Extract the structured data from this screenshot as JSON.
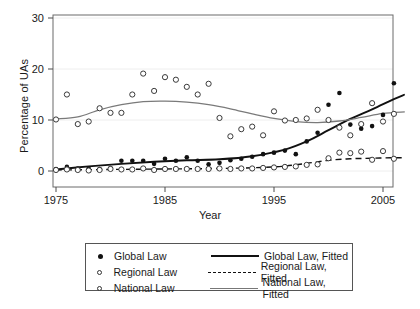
{
  "chart_data": {
    "type": "scatter",
    "title": "",
    "xlabel": "Year",
    "ylabel": "Percentage of UAs",
    "xlim": [
      1974,
      2008
    ],
    "ylim": [
      -1,
      31
    ],
    "xticks": [
      1975,
      1985,
      1995,
      2005
    ],
    "yticks": [
      0,
      10,
      20,
      30
    ],
    "grid": "horizontal-faint",
    "legend_position": "below-plot",
    "x": [
      1975,
      1976,
      1977,
      1978,
      1979,
      1980,
      1981,
      1982,
      1983,
      1984,
      1985,
      1986,
      1987,
      1988,
      1989,
      1990,
      1991,
      1992,
      1993,
      1994,
      1995,
      1996,
      1997,
      1998,
      1999,
      2000,
      2001,
      2002,
      2003,
      2004,
      2005,
      2006,
      2007
    ],
    "series": [
      {
        "name": "Global Law",
        "marker": "filled-circle",
        "values": [
          0.4,
          0.8,
          0.5,
          0.5,
          0.4,
          0.6,
          2.0,
          2.0,
          2.0,
          1.4,
          2.4,
          2.0,
          2.7,
          2.0,
          1.3,
          1.6,
          2.1,
          2.4,
          2.8,
          3.3,
          3.6,
          4.0,
          3.3,
          5.8,
          7.5,
          13.0,
          15.3,
          9.1,
          8.3,
          8.8,
          11.0,
          17.2,
          18.4
        ]
      },
      {
        "name": "Regional Law",
        "marker": "open-circle",
        "values": [
          0.2,
          0.3,
          0.2,
          0.1,
          0.2,
          0.4,
          0.3,
          0.3,
          0.5,
          0.2,
          0.4,
          0.4,
          0.4,
          0.4,
          0.4,
          0.5,
          0.4,
          0.5,
          0.5,
          0.6,
          0.7,
          0.8,
          0.9,
          1.2,
          1.3,
          2.5,
          3.6,
          3.5,
          3.8,
          2.2,
          3.9,
          2.4,
          2.0
        ]
      },
      {
        "name": "National Law",
        "marker": "open-circle",
        "values": [
          10.1,
          15.0,
          9.2,
          9.7,
          12.3,
          11.4,
          11.4,
          15.0,
          19.1,
          15.7,
          18.4,
          17.9,
          16.5,
          15.0,
          17.1,
          10.4,
          6.8,
          8.2,
          8.7,
          7.0,
          11.7,
          9.9,
          10.0,
          10.3,
          12.0,
          10.0,
          8.5,
          7.0,
          9.2,
          13.3,
          9.7,
          11.2,
          10.0
        ]
      }
    ],
    "fits": [
      {
        "name": "Global Law, Fitted",
        "style": "solid-thick",
        "x": [
          1975,
          1978,
          1981,
          1984,
          1987,
          1990,
          1993,
          1996,
          1998,
          2000,
          2002,
          2004,
          2006,
          2007
        ],
        "y": [
          0.3,
          0.9,
          1.4,
          1.8,
          2.1,
          2.3,
          2.9,
          4.2,
          5.8,
          8.0,
          10.2,
          12.1,
          14.1,
          15.0
        ]
      },
      {
        "name": "Regional Law, Fitted",
        "style": "dashed",
        "x": [
          1975,
          1980,
          1985,
          1990,
          1995,
          1998,
          2000,
          2002,
          2004,
          2006,
          2007
        ],
        "y": [
          0.2,
          0.3,
          0.4,
          0.5,
          0.8,
          1.5,
          2.1,
          2.4,
          2.5,
          2.6,
          2.6
        ]
      },
      {
        "name": "National Law, Fitted",
        "style": "solid-thin",
        "x": [
          1975,
          1977,
          1979,
          1981,
          1983,
          1985,
          1987,
          1989,
          1991,
          1993,
          1995,
          1997,
          1999,
          2001,
          2003,
          2005,
          2007
        ],
        "y": [
          10.2,
          10.6,
          12.0,
          13.0,
          13.6,
          13.7,
          13.5,
          13.0,
          12.2,
          11.2,
          10.3,
          9.7,
          9.5,
          9.8,
          10.5,
          11.3,
          11.6
        ]
      }
    ]
  },
  "legend": {
    "rows": [
      {
        "marker": "filled-circle",
        "label": "Global Law",
        "line": "solid-thick",
        "fit_label": "Global Law, Fitted"
      },
      {
        "marker": "open-circle",
        "label": "Regional Law",
        "line": "dashed",
        "fit_label": "Regional Law, Fitted"
      },
      {
        "marker": "open-circle",
        "label": "National Law",
        "line": "solid-thin",
        "fit_label": "National Law, Fitted"
      }
    ]
  }
}
